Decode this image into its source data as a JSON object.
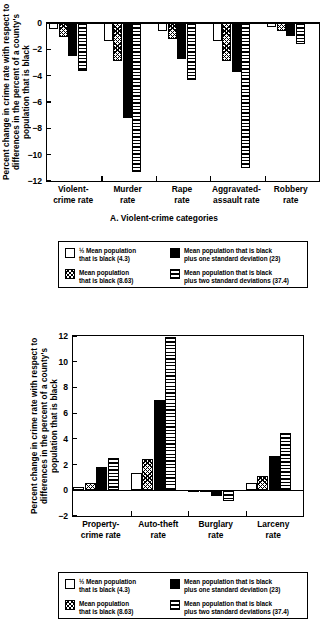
{
  "legend": {
    "items": [
      {
        "swatch": "white",
        "label": "½ Mean population\nthat is black (4.3)"
      },
      {
        "swatch": "hatch",
        "label": "Mean population\nthat is black (8.63)"
      },
      {
        "swatch": "black",
        "label": "Mean population that is black\nplus one standard deviation (23)"
      },
      {
        "swatch": "horz",
        "label": "Mean population that is black\nplus two standard deviations (37.4)"
      }
    ]
  },
  "chart_data": [
    {
      "type": "bar",
      "panel": "A",
      "title": "A. Violent-crime categories",
      "ylabel": "Percent change in crime rate with respect to\ndifferences in the percent of a county's\npopulation that is  black",
      "xlabel": "",
      "categories": [
        "Violent-\ncrime rate",
        "Murder\nrate",
        "Rape\nrate",
        "Aggravated-\nassault rate",
        "Robbery\nrate"
      ],
      "yticks": [
        0,
        -2,
        -4,
        -6,
        -8,
        -10,
        -12
      ],
      "ylim": [
        -12,
        0
      ],
      "grid": false,
      "legend_position": "below",
      "series": [
        {
          "name": "½ Mean population that is black (4.3)",
          "swatch": "white",
          "values": [
            -0.45,
            -1.4,
            -0.6,
            -1.4,
            -0.3
          ]
        },
        {
          "name": "Mean population that is black (8.63)",
          "swatch": "hatch",
          "values": [
            -1.1,
            -2.9,
            -1.25,
            -2.9,
            -0.6
          ]
        },
        {
          "name": "Mean population that is black plus one standard deviation (23)",
          "swatch": "black",
          "values": [
            -2.5,
            -7.2,
            -2.7,
            -3.75,
            -1.0
          ]
        },
        {
          "name": "Mean population that is black plus two standard deviations (37.4)",
          "swatch": "horz",
          "values": [
            -3.65,
            -11.3,
            -4.3,
            -11.0,
            -1.6
          ]
        }
      ]
    },
    {
      "type": "bar",
      "panel": "B",
      "title": "B. Property-crime categories",
      "ylabel": "Percent change in crime rate with respect to\ndifferences in the percent of a county's\npopulation that is  black",
      "xlabel": "",
      "categories": [
        "Property-\ncrime rate",
        "Auto-theft\nrate",
        "Burglary\nrate",
        "Larceny\nrate"
      ],
      "yticks": [
        12,
        10,
        8,
        6,
        4,
        2,
        0,
        -2
      ],
      "ylim": [
        -2,
        12
      ],
      "grid": false,
      "legend_position": "below",
      "series": [
        {
          "name": "½ Mean population that is black (4.3)",
          "swatch": "white",
          "values": [
            0.25,
            1.35,
            -0.05,
            0.55
          ]
        },
        {
          "name": "Mean population that is black (8.63)",
          "swatch": "hatch",
          "values": [
            0.6,
            2.4,
            -0.15,
            1.1
          ]
        },
        {
          "name": "Mean population that is black plus one standard deviation (23)",
          "swatch": "black",
          "values": [
            1.8,
            7.05,
            -0.45,
            2.7
          ]
        },
        {
          "name": "Mean population that is black plus two standard deviations (37.4)",
          "swatch": "horz",
          "values": [
            2.55,
            11.95,
            -0.8,
            4.45
          ]
        }
      ]
    }
  ]
}
